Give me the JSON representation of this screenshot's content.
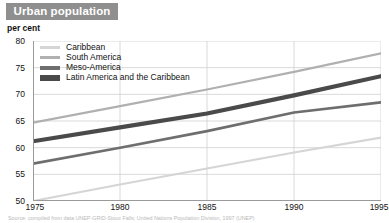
{
  "header": {
    "title": "Urban population"
  },
  "unit_label": "per cent",
  "source_note": "Source: compiled from data UNEP-GRID-Sioux Falls; United Nations Population Division, 1997 (UNEP)",
  "colors": {
    "banner_background": "#8f8f8f",
    "banner_text": "#ffffff",
    "grid": "#cfcfcf",
    "axis": "#9a9a9a",
    "caribbean": "#d5d5d5",
    "south_america": "#b0b0b0",
    "meso_america": "#6e6e6e",
    "latin_america": "#4a4a4a",
    "text": "#111111"
  },
  "legend": {
    "items": [
      {
        "label": "Caribbean",
        "color": "#d5d5d5"
      },
      {
        "label": "South America",
        "color": "#b0b0b0"
      },
      {
        "label": "Meso-America",
        "color": "#6e6e6e"
      },
      {
        "label": "Latin America and the Caribbean",
        "color": "#4a4a4a"
      }
    ]
  },
  "chart_data": {
    "type": "line",
    "title": "Urban population",
    "xlabel": "",
    "ylabel": "per cent",
    "ylim": [
      50,
      80
    ],
    "xlim": [
      1975,
      1995
    ],
    "yticks": [
      50,
      55,
      60,
      65,
      70,
      75,
      80
    ],
    "xticks": [
      1975,
      1980,
      1985,
      1990,
      1995
    ],
    "grid": true,
    "legend_position": "top-left",
    "x": [
      1975,
      1980,
      1985,
      1990,
      1995
    ],
    "series": [
      {
        "name": "Caribbean",
        "color": "#d5d5d5",
        "width": 2.2,
        "values": [
          50.0,
          53.1,
          56.1,
          59.1,
          61.9
        ]
      },
      {
        "name": "South America",
        "color": "#b0b0b0",
        "width": 2.2,
        "values": [
          64.7,
          67.8,
          70.9,
          74.2,
          77.7
        ]
      },
      {
        "name": "Meso-America",
        "color": "#6e6e6e",
        "width": 2.6,
        "values": [
          57.0,
          60.0,
          63.1,
          66.6,
          68.5
        ]
      },
      {
        "name": "Latin America and the Caribbean",
        "color": "#4a4a4a",
        "width": 4.2,
        "values": [
          61.2,
          63.8,
          66.4,
          69.8,
          73.4
        ]
      }
    ]
  }
}
